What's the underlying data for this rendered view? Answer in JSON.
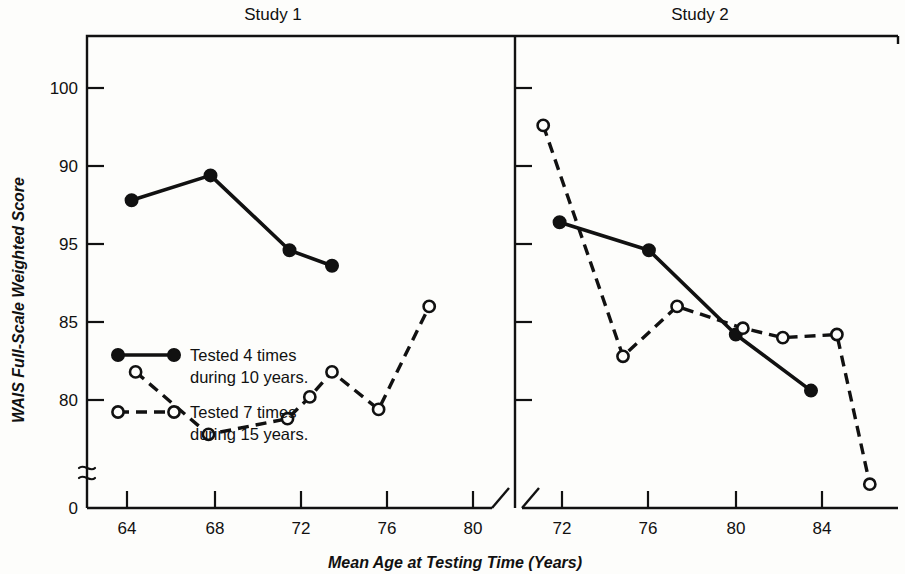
{
  "chart_data": {
    "type": "line",
    "title": "",
    "xlabel": "Mean Age at Testing Time (Years)",
    "ylabel": "WAIS Full-Scale Weighted Score",
    "grid": false,
    "legend_position": "inside-lower-left-of-panel-1",
    "y_tick_labels": [
      "100",
      "90",
      "95",
      "85",
      "80",
      "0"
    ],
    "y_axis_note": "Axis printed with a break between 80 and 0; tick labels reproduce the original print order (100, 90, 95, 85, 80, 0).",
    "panels": [
      {
        "name": "Study 1",
        "title": "Study 1",
        "x_tick_labels": [
          "64",
          "68",
          "72",
          "76",
          "80"
        ],
        "xlim": [
          62,
          82
        ],
        "series": [
          {
            "name": "Tested 4 times during 10 years.",
            "marker": "filled-circle",
            "line": "solid",
            "x": [
              64.2,
              68.1,
              72.0,
              74.1
            ],
            "y": [
              96.4,
              97.2,
              94.8,
              94.3
            ]
          },
          {
            "name": "Tested 7 times during 15 years.",
            "marker": "open-circle",
            "line": "dashed",
            "x": [
              64.4,
              68.0,
              71.9,
              73.0,
              74.1,
              76.4,
              78.9
            ],
            "y": [
              90.9,
              88.9,
              89.4,
              90.1,
              90.9,
              89.7,
              93.0
            ]
          }
        ]
      },
      {
        "name": "Study 2",
        "title": "Study 2",
        "x_tick_labels": [
          "72",
          "76",
          "80",
          "84"
        ],
        "xlim": [
          70.5,
          86.5
        ],
        "series": [
          {
            "name": "Tested 4 times during 10 years.",
            "marker": "filled-circle",
            "line": "solid",
            "x": [
              72.1,
              75.9,
              79.6,
              82.8
            ],
            "y": [
              95.7,
              94.8,
              92.1,
              90.3
            ]
          },
          {
            "name": "Tested 7 times during 15 years.",
            "marker": "open-circle",
            "line": "dashed",
            "x": [
              71.4,
              74.8,
              77.1,
              79.9,
              81.6,
              83.9,
              85.3
            ],
            "y": [
              98.8,
              91.4,
              93.0,
              92.3,
              92.0,
              92.1,
              87.3
            ]
          }
        ]
      }
    ],
    "legend": [
      {
        "label_line1": "Tested 4 times",
        "label_line2": "during 10 years.",
        "marker": "filled-circle",
        "line": "solid"
      },
      {
        "label_line1": "Tested 7 times",
        "label_line2": "during 15 years.",
        "marker": "open-circle",
        "line": "dashed"
      }
    ]
  }
}
